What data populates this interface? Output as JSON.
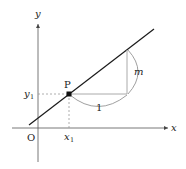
{
  "diagram": {
    "labels": {
      "y_axis": "y",
      "x_axis": "x",
      "origin": "O",
      "point": "P",
      "y1_main": "y",
      "y1_sub": "1",
      "x1_main": "x",
      "x1_sub": "1",
      "run": "1",
      "rise": "m"
    },
    "colors": {
      "line": "#1a1a1a",
      "axis": "#333333",
      "guide": "#999999",
      "triangle": "#9a9a9a",
      "brace": "#8a8a8a"
    }
  }
}
